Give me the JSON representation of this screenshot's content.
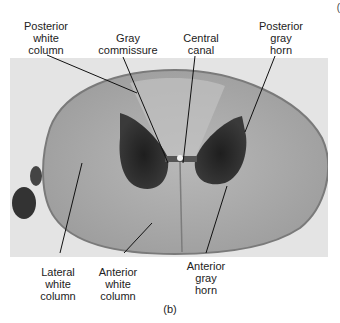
{
  "figure": {
    "caption": "(b)",
    "corner_mark": "("
  },
  "labels": [
    {
      "id": "posterior-white-column",
      "text": "Posterior\nwhite\ncolumn"
    },
    {
      "id": "gray-commissure",
      "text": "Gray\ncommissure"
    },
    {
      "id": "central-canal",
      "text": "Central\ncanal"
    },
    {
      "id": "posterior-gray-horn",
      "text": "Posterior\ngray\nhorn"
    },
    {
      "id": "lateral-white-column",
      "text": "Lateral\nwhite\ncolumn"
    },
    {
      "id": "anterior-white-column",
      "text": "Anterior\nwhite\ncolumn"
    },
    {
      "id": "anterior-gray-horn",
      "text": "Anterior\ngray\nhorn"
    }
  ],
  "colors": {
    "photo_bg": "#e4e4e4",
    "cord": "#a8a8a8",
    "gray_matter": "#2a2a2a",
    "leader": "#111111"
  }
}
